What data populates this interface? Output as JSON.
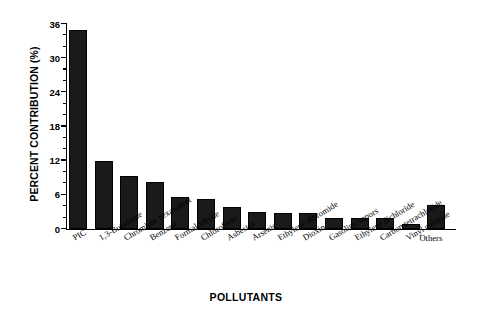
{
  "chart_data": {
    "type": "bar",
    "title": "",
    "xlabel": "POLLUTANTS",
    "ylabel": "PERCENT CONTRIBUTION (%)",
    "ylim": [
      0,
      36
    ],
    "ytick_values": [
      0,
      6,
      12,
      18,
      24,
      30,
      36
    ],
    "ytick_labels": [
      "0",
      "6",
      "12",
      "18",
      "24",
      "30",
      "36"
    ],
    "minor_ticks_per_interval": 2,
    "grid": false,
    "legend": null,
    "bar_color": "#1a1a1a",
    "categories": [
      "PIC",
      "1,3-Butadiene",
      "Chromium hexavalent",
      "Benzene",
      "Formaldehyde",
      "Chloroform",
      "Asbestos",
      "Arsenic",
      "Ethylene dibromide",
      "Dioxin",
      "Gasoline vapors",
      "Ethylene dichloride",
      "Carbon tetrachloride",
      "Vinyl chloride",
      "Others"
    ],
    "values": [
      35.0,
      12.0,
      9.3,
      8.2,
      5.7,
      5.3,
      3.8,
      3.0,
      2.9,
      2.8,
      2.0,
      2.0,
      1.9,
      0.9,
      4.3
    ],
    "label_rotation_deg": -31,
    "last_label_horizontal": true
  }
}
